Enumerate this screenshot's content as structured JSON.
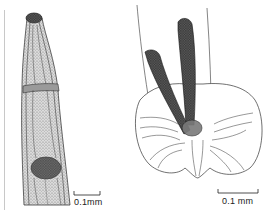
{
  "figure": {
    "panels": [
      {
        "id": "left",
        "subject": "nematode anterior end",
        "scale_bar": "0.1mm"
      },
      {
        "id": "right",
        "subject": "male bursa with spicules",
        "scale_bar": "0.1 mm"
      }
    ]
  },
  "colors": {
    "ink": "#2a2a2a",
    "shade": "#8a8a8a",
    "paper": "#ffffff"
  }
}
